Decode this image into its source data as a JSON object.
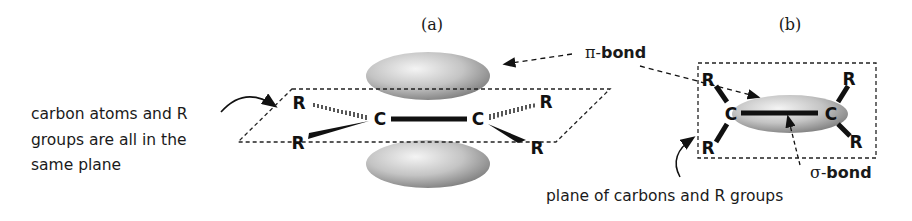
{
  "panels": {
    "a": {
      "label": "(a)"
    },
    "b": {
      "label": "(b)"
    }
  },
  "annotations": {
    "plane_note_line1": "carbon atoms and R",
    "plane_note_line2": "groups are all in the",
    "plane_note_line3": "same plane",
    "pi_bond_prefix": "π-",
    "pi_bond_word": "bond",
    "sigma_bond_prefix": "σ-",
    "sigma_bond_word": "bond",
    "plane_caption": "plane of carbons and R groups"
  },
  "atoms": {
    "carbon": "C",
    "r_group": "R"
  },
  "colors": {
    "ink": "#111111",
    "orbital_light": "#e8e8e8",
    "orbital_dark": "#8a8a8a"
  }
}
